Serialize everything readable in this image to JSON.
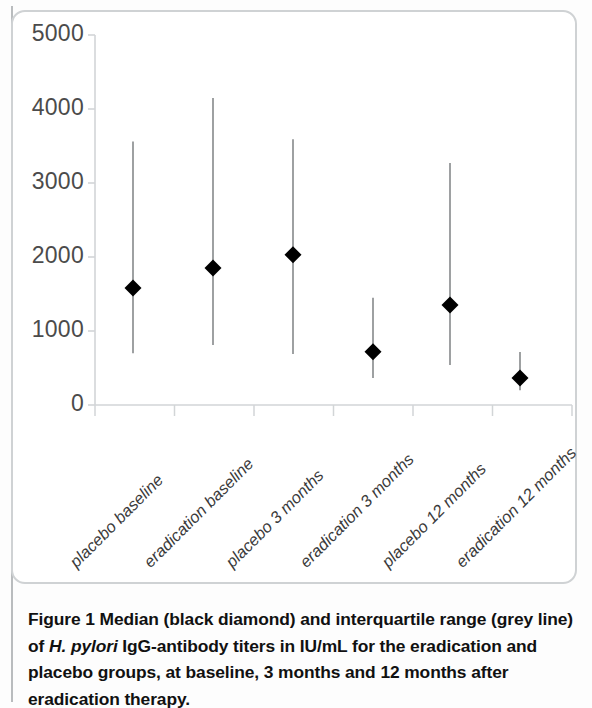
{
  "figure": {
    "label": "Figure 1",
    "caption_part1": "Median (black diamond) and interquartile range (grey line) of ",
    "caption_italic": "H. pylori",
    "caption_part2": " IgG-antibody titers in IU/mL for the eradication and placebo groups, at baseline, 3 months and 12 months after eradication therapy."
  },
  "chart_data": {
    "type": "scatter",
    "title": "",
    "xlabel": "",
    "ylabel": "",
    "ylim": [
      0,
      5000
    ],
    "yticks": [
      0,
      1000,
      2000,
      3000,
      4000,
      5000
    ],
    "ytick_labels": [
      "0",
      "1000",
      "2000",
      "3000",
      "4000",
      "5000"
    ],
    "grid": false,
    "legend": "none",
    "marker": "diamond",
    "marker_color": "#000000",
    "line_color": "#8d9092",
    "axis_color": "#d2d5d7",
    "units": "IU/mL",
    "categories": [
      "placebo baseline",
      "eradication baseline",
      "placebo 3 months",
      "eradication 3 months",
      "placebo 12 months",
      "eradication 12 months"
    ],
    "medians": [
      1580,
      1850,
      2030,
      720,
      1350,
      365
    ],
    "iqr_low": [
      700,
      810,
      690,
      365,
      540,
      200
    ],
    "iqr_high": [
      3560,
      4150,
      3590,
      1450,
      3270,
      715
    ],
    "points": [
      {
        "category": "placebo baseline",
        "median": 1580,
        "q1": 700,
        "q3": 3560
      },
      {
        "category": "eradication baseline",
        "median": 1850,
        "q1": 810,
        "q3": 4150
      },
      {
        "category": "placebo 3 months",
        "median": 2030,
        "q1": 690,
        "q3": 3590
      },
      {
        "category": "eradication 3 months",
        "median": 720,
        "q1": 365,
        "q3": 1450
      },
      {
        "category": "placebo 12 months",
        "median": 1350,
        "q1": 540,
        "q3": 3270
      },
      {
        "category": "eradication 12 months",
        "median": 365,
        "q1": 200,
        "q3": 715
      }
    ]
  }
}
